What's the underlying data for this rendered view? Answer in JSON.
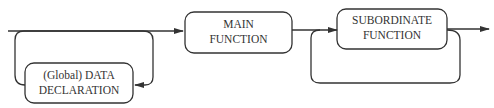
{
  "diagram": {
    "nodes": [
      {
        "id": "data",
        "line1": "(Global) DATA",
        "line2": "DECLARATION"
      },
      {
        "id": "main",
        "line1": "MAIN",
        "line2": "FUNCTION"
      },
      {
        "id": "sub",
        "line1": "SUBORDINATE",
        "line2": "FUNCTION"
      }
    ],
    "colors": {
      "stroke": "#333333",
      "background": "#ffffff"
    }
  }
}
